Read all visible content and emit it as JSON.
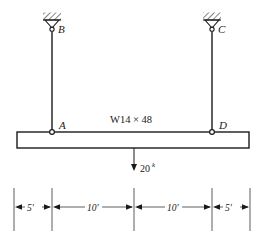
{
  "figure": {
    "type": "structural-beam-diagram",
    "stroke_color": "#1a1a1a",
    "dim_color": "#4d4d4d",
    "background": "#ffffff"
  },
  "beam": {
    "section_label": "W14 × 48",
    "left_x": 17,
    "right_x": 249,
    "top_y": 132,
    "bottom_y": 148
  },
  "supports": [
    {
      "name": "support-b",
      "label": "B",
      "x": 52,
      "hatch_y": 13
    },
    {
      "name": "support-c",
      "label": "C",
      "x": 212,
      "hatch_y": 13
    }
  ],
  "joints": [
    {
      "name": "joint-b",
      "label": "B",
      "x": 52,
      "y": 28
    },
    {
      "name": "joint-c",
      "label": "C",
      "x": 212,
      "y": 28
    },
    {
      "name": "joint-a",
      "label": "A",
      "x": 52,
      "y": 132
    },
    {
      "name": "joint-d",
      "label": "D",
      "x": 212,
      "y": 132
    }
  ],
  "hangers": [
    {
      "name": "hanger-rod-ab",
      "x": 52,
      "top_y": 32,
      "bottom_y": 132
    },
    {
      "name": "hanger-rod-cd",
      "x": 212,
      "top_y": 32,
      "bottom_y": 132
    }
  ],
  "load": {
    "label": "20",
    "superscript": "k",
    "units": "kips",
    "x": 134,
    "start_y": 148,
    "end_y": 170
  },
  "dimensions": {
    "extension_lines": [
      14,
      52,
      134,
      212,
      250
    ],
    "baseline_y": 207,
    "ext_top_y": 188,
    "ext_bottom_y": 231,
    "segments": [
      {
        "name": "dim-segment-1",
        "label": "5'",
        "from": 14,
        "to": 52
      },
      {
        "name": "dim-segment-2",
        "label": "10'",
        "from": 52,
        "to": 134
      },
      {
        "name": "dim-segment-3",
        "label": "10'",
        "from": 134,
        "to": 212
      },
      {
        "name": "dim-segment-4",
        "label": "5'",
        "from": 212,
        "to": 250
      }
    ]
  }
}
